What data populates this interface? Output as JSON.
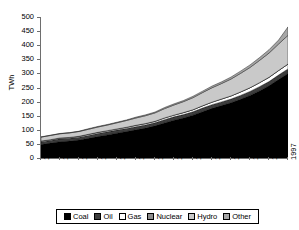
{
  "chart_data": {
    "type": "area",
    "stacked": true,
    "title": "",
    "xlabel": "",
    "ylabel": "TWh",
    "ylim": [
      0,
      500
    ],
    "ytick_step": 50,
    "ytick_labels": [
      "500",
      "450",
      "400",
      "350",
      "300",
      "250",
      "200",
      "150",
      "100",
      "50",
      "0"
    ],
    "grid": false,
    "legend_position": "bottom",
    "x": [
      1971,
      1972,
      1973,
      1974,
      1975,
      1976,
      1977,
      1978,
      1979,
      1980,
      1981,
      1982,
      1983,
      1984,
      1985,
      1986,
      1987,
      1988,
      1989,
      1990,
      1991,
      1992,
      1993,
      1994,
      1995,
      1996,
      1997
    ],
    "xtick_labels": [
      "1971",
      "1973",
      "1975",
      "1977",
      "1979",
      "1981",
      "1983",
      "1985",
      "1987",
      "1989",
      "1991",
      "1993",
      "1995",
      "1997"
    ],
    "series": [
      {
        "name": "Coal",
        "color": "#000000",
        "values": [
          48,
          53,
          58,
          60,
          64,
          70,
          76,
          82,
          88,
          94,
          100,
          106,
          114,
          124,
          134,
          142,
          152,
          164,
          176,
          186,
          196,
          208,
          222,
          238,
          256,
          278,
          300
        ]
      },
      {
        "name": "Oil",
        "color": "#3d3d3d",
        "values": [
          9,
          9,
          10,
          10,
          10,
          10,
          11,
          11,
          11,
          11,
          11,
          11,
          11,
          12,
          12,
          12,
          12,
          13,
          13,
          13,
          13,
          14,
          14,
          15,
          15,
          16,
          16
        ]
      },
      {
        "name": "Gas",
        "color": "#ffffff",
        "values": [
          3,
          3,
          3,
          3,
          3,
          4,
          4,
          4,
          4,
          4,
          5,
          5,
          5,
          6,
          6,
          7,
          7,
          8,
          9,
          10,
          11,
          12,
          13,
          14,
          15,
          16,
          17
        ]
      },
      {
        "name": "Nuclear",
        "color": "#8c8c8c",
        "values": [
          0,
          0,
          0,
          0,
          0,
          0,
          0,
          0,
          0,
          0,
          0,
          0,
          0,
          0,
          0,
          0,
          0,
          0,
          0,
          0,
          0,
          0,
          0,
          0,
          0,
          0,
          0
        ]
      },
      {
        "name": "Hydro",
        "color": "#c9c9c9",
        "values": [
          14,
          15,
          15,
          16,
          17,
          18,
          19,
          20,
          22,
          24,
          26,
          28,
          30,
          33,
          36,
          39,
          43,
          47,
          51,
          55,
          60,
          66,
          72,
          79,
          86,
          94,
          102
        ]
      },
      {
        "name": "Other",
        "color": "#a6a6a6",
        "values": [
          1,
          1,
          1,
          1,
          1,
          2,
          2,
          2,
          2,
          2,
          3,
          3,
          3,
          4,
          4,
          4,
          5,
          5,
          6,
          6,
          7,
          8,
          9,
          10,
          12,
          14,
          30
        ]
      }
    ],
    "totals": [
      75,
      81,
      87,
      90,
      95,
      104,
      112,
      119,
      127,
      135,
      145,
      153,
      163,
      179,
      192,
      204,
      219,
      237,
      255,
      270,
      287,
      308,
      330,
      356,
      384,
      418,
      465
    ],
    "legend_entries": [
      {
        "label": "Coal",
        "color": "#000000"
      },
      {
        "label": "Oil",
        "color": "#3d3d3d"
      },
      {
        "label": "Gas",
        "color": "#ffffff"
      },
      {
        "label": "Nuclear",
        "color": "#8c8c8c"
      },
      {
        "label": "Hydro",
        "color": "#c9c9c9"
      },
      {
        "label": "Other",
        "color": "#a6a6a6"
      }
    ]
  }
}
